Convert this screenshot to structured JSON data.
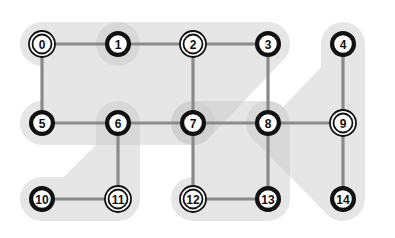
{
  "canvas": {
    "width": 395,
    "height": 238,
    "background": "#ffffff"
  },
  "style": {
    "node_fill": "#ffffff",
    "node_stroke": "#111111",
    "node_radius": 13,
    "node_stroke_width": 4.2,
    "double_ring_outer_radius": 13,
    "double_ring_inner_radius": 9.5,
    "double_ring_stroke_width": 1.8,
    "edge_color": "#8a8a8a",
    "edge_width": 3.2,
    "label_color": "#111111",
    "label_font_size": 12,
    "region_fill": "#c9c9c9",
    "region_opacity": 0.45,
    "region_corner_radius": 22
  },
  "grid": {
    "columns_x": [
      42,
      118,
      193,
      268,
      343
    ],
    "rows_y": [
      44,
      123,
      199
    ],
    "spacing_x": 75,
    "spacing_y": 78
  },
  "graph": {
    "node_count": 15,
    "nodes": [
      {
        "id": "0",
        "label": "0",
        "x": 42,
        "y": 44,
        "ring": "double"
      },
      {
        "id": "1",
        "label": "1",
        "x": 118,
        "y": 44,
        "ring": "single"
      },
      {
        "id": "2",
        "label": "2",
        "x": 193,
        "y": 44,
        "ring": "double"
      },
      {
        "id": "3",
        "label": "3",
        "x": 268,
        "y": 44,
        "ring": "single"
      },
      {
        "id": "4",
        "label": "4",
        "x": 343,
        "y": 44,
        "ring": "single"
      },
      {
        "id": "5",
        "label": "5",
        "x": 42,
        "y": 123,
        "ring": "single"
      },
      {
        "id": "6",
        "label": "6",
        "x": 118,
        "y": 123,
        "ring": "single"
      },
      {
        "id": "7",
        "label": "7",
        "x": 193,
        "y": 123,
        "ring": "single"
      },
      {
        "id": "8",
        "label": "8",
        "x": 268,
        "y": 123,
        "ring": "single"
      },
      {
        "id": "9",
        "label": "9",
        "x": 343,
        "y": 123,
        "ring": "double"
      },
      {
        "id": "10",
        "label": "10",
        "x": 42,
        "y": 199,
        "ring": "single"
      },
      {
        "id": "11",
        "label": "11",
        "x": 118,
        "y": 199,
        "ring": "double"
      },
      {
        "id": "12",
        "label": "12",
        "x": 193,
        "y": 199,
        "ring": "double"
      },
      {
        "id": "13",
        "label": "13",
        "x": 268,
        "y": 199,
        "ring": "single"
      },
      {
        "id": "14",
        "label": "14",
        "x": 343,
        "y": 199,
        "ring": "single"
      }
    ],
    "edges": [
      {
        "from": "0",
        "to": "1"
      },
      {
        "from": "1",
        "to": "2"
      },
      {
        "from": "2",
        "to": "3"
      },
      {
        "from": "0",
        "to": "5"
      },
      {
        "from": "2",
        "to": "7"
      },
      {
        "from": "3",
        "to": "8"
      },
      {
        "from": "4",
        "to": "9"
      },
      {
        "from": "5",
        "to": "6"
      },
      {
        "from": "6",
        "to": "7"
      },
      {
        "from": "7",
        "to": "8"
      },
      {
        "from": "8",
        "to": "9"
      },
      {
        "from": "6",
        "to": "11"
      },
      {
        "from": "7",
        "to": "12"
      },
      {
        "from": "8",
        "to": "13"
      },
      {
        "from": "9",
        "to": "14"
      },
      {
        "from": "10",
        "to": "11"
      },
      {
        "from": "12",
        "to": "13"
      }
    ],
    "regions": [
      {
        "id": "region-top-left",
        "members": [
          "0",
          "1",
          "2",
          "3",
          "5"
        ],
        "points": "42,44 268,44 193,123 42,123"
      },
      {
        "id": "region-right",
        "members": [
          "4",
          "9",
          "14"
        ],
        "points": "343,44 343,199 268,123"
      },
      {
        "id": "region-left-lower",
        "members": [
          "6",
          "10",
          "11"
        ],
        "points": "118,123 118,199 42,199"
      },
      {
        "id": "region-center",
        "members": [
          "7",
          "8",
          "12",
          "13"
        ],
        "points": "193,123 268,123 268,199 193,199"
      },
      {
        "id": "region-node-1",
        "members": [
          "1"
        ],
        "points": "118,44 118,44"
      },
      {
        "id": "region-node-7",
        "members": [
          "7"
        ],
        "points": "193,123 193,123"
      }
    ]
  }
}
